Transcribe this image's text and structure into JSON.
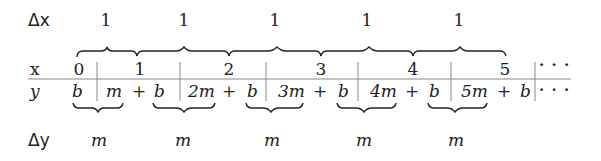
{
  "row_labels": {
    "dx": "Δx",
    "x": "x",
    "y": "y",
    "dy": "Δy"
  },
  "dx_values": [
    "1",
    "1",
    "1",
    "1",
    "1"
  ],
  "x_values": [
    "0",
    "1",
    "2",
    "3",
    "4",
    "5",
    "· · ·"
  ],
  "y_values": [
    "b",
    "m + b",
    "2m + b",
    "3m + b",
    "4m + b",
    "5m + b",
    "· · ·"
  ],
  "y_cells": {
    "c0": "b",
    "c1a": "m",
    "c1b": "+",
    "c1c": "b",
    "c2a": "2m",
    "c2b": "+",
    "c2c": "b",
    "c3a": "3m",
    "c3b": "+",
    "c3c": "b",
    "c4a": "4m",
    "c4b": "+",
    "c4c": "b",
    "c5a": "5m",
    "c5b": "+",
    "c5c": "b",
    "ellipsis": "· · ·"
  },
  "dy_values": [
    "m",
    "m",
    "m",
    "m",
    "m"
  ],
  "colors": {
    "ink": "#222222",
    "line": "#888888",
    "background": "#ffffff"
  }
}
